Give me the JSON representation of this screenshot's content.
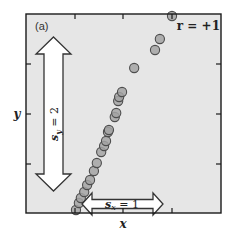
{
  "panel_label": "(a)",
  "annotation_r": "r = +1",
  "sy_label": "s_y = 2",
  "sy_text": {
    "s": "s",
    "sub": "y",
    "rest": " = 2"
  },
  "sx_text": {
    "s": "s",
    "sub": "x",
    "rest": " = 1"
  },
  "colors": {
    "plot_bg": "#e6e6e6",
    "frame": "#1a1a1a",
    "point_fill": "#a3a3a3",
    "point_stroke": "#4d4d4d",
    "arrow_fill": "#ffffff",
    "arrow_stroke": "#333333"
  },
  "chart_data": {
    "type": "scatter",
    "title": "(a)",
    "xlabel": "x",
    "ylabel": "y",
    "annotation": "r = +1",
    "grid": false,
    "legend": null,
    "x_ticks_count": 3,
    "y_ticks_count": 3,
    "xlim": [
      -1.0,
      3.0
    ],
    "ylim": [
      0.0,
      4.0
    ],
    "tick_labels_shown": false,
    "stats": {
      "s_x": 1,
      "s_y": 2,
      "r": 1
    },
    "points": [
      {
        "x": 0.02,
        "y": 0.06
      },
      {
        "x": 0.08,
        "y": 0.2
      },
      {
        "x": 0.12,
        "y": 0.3
      },
      {
        "x": 0.19,
        "y": 0.42
      },
      {
        "x": 0.25,
        "y": 0.56
      },
      {
        "x": 0.31,
        "y": 0.66
      },
      {
        "x": 0.39,
        "y": 0.84
      },
      {
        "x": 0.45,
        "y": 1.0
      },
      {
        "x": 0.54,
        "y": 1.22
      },
      {
        "x": 0.6,
        "y": 1.34
      },
      {
        "x": 0.64,
        "y": 1.44
      },
      {
        "x": 0.68,
        "y": 1.62
      },
      {
        "x": 0.7,
        "y": 1.66
      },
      {
        "x": 0.82,
        "y": 1.92
      },
      {
        "x": 0.85,
        "y": 2.0
      },
      {
        "x": 0.89,
        "y": 2.24
      },
      {
        "x": 0.91,
        "y": 2.32
      },
      {
        "x": 0.97,
        "y": 2.42
      },
      {
        "x": 1.22,
        "y": 2.9
      },
      {
        "x": 1.65,
        "y": 3.26
      },
      {
        "x": 1.75,
        "y": 3.48
      },
      {
        "x": 2.0,
        "y": 3.94
      }
    ]
  }
}
